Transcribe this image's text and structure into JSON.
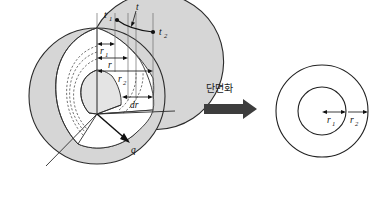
{
  "figure": {
    "caption_korean": "단면화",
    "left_diagram": {
      "name": "cutaway-sphere",
      "labels": {
        "t1": "t",
        "t1_sub": "1",
        "t_mid": "t",
        "t2": "t",
        "t2_sub": "2",
        "r1": "r",
        "r1_sub": "1",
        "r_mid": "r",
        "r2": "r",
        "r2_sub": "2",
        "dr": "dr",
        "q": "q"
      }
    },
    "right_diagram": {
      "name": "concentric-circles-cross-section",
      "labels": {
        "r1": "r",
        "r1_sub": "1",
        "r2": "r",
        "r2_sub": "2"
      }
    },
    "colors": {
      "sphere_fill": "#d6d6d6",
      "cut_face_fill": "#ffffff",
      "core_fill": "#e4e4e4",
      "outline": "#2b2b2b",
      "arrow_block": "#3d3d3d",
      "background": "#ffffff"
    }
  }
}
